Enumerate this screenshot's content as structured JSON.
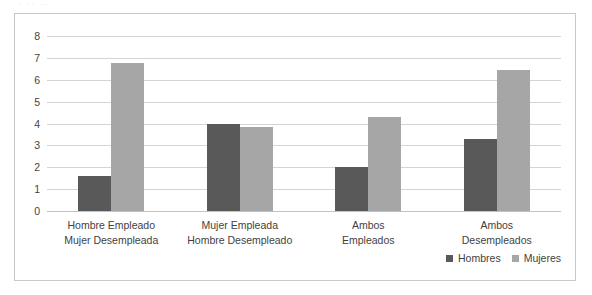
{
  "scan_artifact_text": "· ·· ··",
  "chart_data": {
    "type": "bar",
    "title": "",
    "subtitle": "",
    "xlabel": "",
    "ylabel": "",
    "ylim": [
      0,
      8
    ],
    "ytick_step": 1,
    "yticks": [
      "8",
      "7",
      "6",
      "5",
      "4",
      "3",
      "2",
      "1",
      "0"
    ],
    "grid": true,
    "legend_position": "bottom-right",
    "categories": [
      {
        "line1": "Hombre Empleado",
        "line2": "Mujer Desempleada"
      },
      {
        "line1": "Mujer Empleada",
        "line2": "Hombre Desempleado"
      },
      {
        "line1": "Ambos",
        "line2": "Empleados"
      },
      {
        "line1": "Ambos",
        "line2": "Desempleados"
      }
    ],
    "series": [
      {
        "name": "Hombres",
        "color": "#595959",
        "values": [
          1.6,
          4.0,
          2.0,
          3.3
        ]
      },
      {
        "name": "Mujeres",
        "color": "#a6a6a6",
        "values": [
          6.75,
          3.85,
          4.3,
          6.45
        ]
      }
    ]
  },
  "legend": {
    "items": [
      {
        "label": "Hombres",
        "color": "#595959"
      },
      {
        "label": "Mujeres",
        "color": "#a6a6a6"
      }
    ]
  }
}
